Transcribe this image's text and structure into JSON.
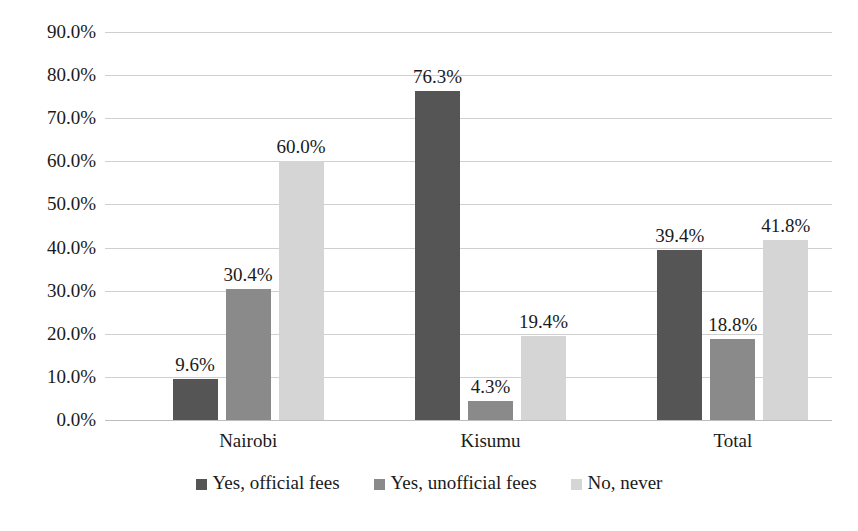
{
  "chart_data": {
    "type": "bar",
    "title": "",
    "subtitle": "",
    "xlabel": "",
    "ylabel": "",
    "categories": [
      "Nairobi",
      "Kisumu",
      "Total"
    ],
    "series": [
      {
        "name": "Yes, official fees",
        "color": "#555555",
        "values": [
          9.6,
          76.3,
          39.4
        ],
        "labels": [
          "9.6%",
          "76.3%",
          "39.4%"
        ]
      },
      {
        "name": "Yes, unofficial fees",
        "color": "#8a8a8a",
        "values": [
          30.4,
          4.3,
          18.8
        ],
        "labels": [
          "30.4%",
          "4.3%",
          "18.8%"
        ]
      },
      {
        "name": "No, never",
        "color": "#d5d5d5",
        "values": [
          60.0,
          19.4,
          41.8
        ],
        "labels": [
          "60.0%",
          "19.4%",
          "41.8%"
        ]
      }
    ],
    "ylim": [
      0,
      90
    ],
    "ytick_values": [
      0,
      10,
      20,
      30,
      40,
      50,
      60,
      70,
      80,
      90
    ],
    "ytick_labels": [
      "0.0%",
      "10.0%",
      "20.0%",
      "30.0%",
      "40.0%",
      "50.0%",
      "60.0%",
      "70.0%",
      "80.0%",
      "90.0%"
    ],
    "grid": true,
    "grid_color": "#cfcfcf",
    "legend_position": "bottom",
    "data_labels_shown": true,
    "background": "#ffffff"
  },
  "legend": {
    "items": [
      {
        "label": "Yes, official fees",
        "color": "#555555"
      },
      {
        "label": "Yes, unofficial fees",
        "color": "#8a8a8a"
      },
      {
        "label": "No, never",
        "color": "#d5d5d5"
      }
    ]
  }
}
